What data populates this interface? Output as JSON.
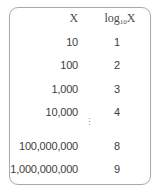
{
  "table": {
    "headers": {
      "x": "X",
      "log_base": "log",
      "log_sub": "10",
      "log_var": "X"
    },
    "rows": [
      {
        "x": "10",
        "log": "1"
      },
      {
        "x": "100",
        "log": "2"
      },
      {
        "x": "1,000",
        "log": "3"
      },
      {
        "x": "10,000",
        "log": "4"
      },
      {
        "x": "100,000,000",
        "log": "8"
      },
      {
        "x": "1,000,000,000",
        "log": "9"
      }
    ],
    "ellipsis": "⋮"
  }
}
